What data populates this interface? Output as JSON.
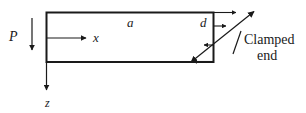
{
  "figure": {
    "type": "engineering-diagram",
    "background_color": "#ffffff",
    "line_color": "#1a1a1a",
    "labels": {
      "load": "P",
      "axis_x": "x",
      "axis_z": "z",
      "length": "a",
      "depth": "d",
      "clamped_line1": "Clamped",
      "clamped_line2": "end"
    },
    "geometry": {
      "beam_rect": {
        "x": 46,
        "y": 12,
        "width": 168,
        "height": 50
      },
      "load_arrow": {
        "x": 32,
        "y1": 18,
        "y2": 52
      },
      "x_axis_arrow": {
        "x1": 47,
        "x2": 88,
        "y": 38
      },
      "z_axis_arrow": {
        "x": 46,
        "y1": 62,
        "y2": 92
      },
      "diagonal": {
        "x1": 190,
        "y1": 62,
        "x2": 255,
        "y2": 11
      },
      "stress_arrows": [
        {
          "x1": 214,
          "x2": 238,
          "y": 12,
          "direction": "right"
        },
        {
          "x1": 214,
          "x2": 228,
          "y": 26,
          "direction": "right"
        },
        {
          "x1": 214,
          "x2": 202,
          "y": 45,
          "direction": "left"
        },
        {
          "x1": 214,
          "x2": 191,
          "y": 62,
          "direction": "left"
        }
      ],
      "pointer": {
        "x1": 233,
        "y1": 52,
        "x2": 240,
        "y2": 33
      }
    }
  }
}
